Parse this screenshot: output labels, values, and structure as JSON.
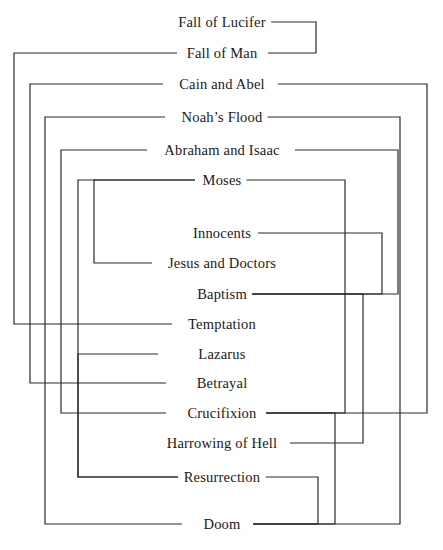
{
  "diagram": {
    "title": "Fall of Lucifer",
    "type": "episode-linkage-diagram",
    "line_color": "#2a2a2a",
    "background_color": "#ffffff",
    "text_color": "#1a1a1a",
    "episodes": [
      {
        "id": "fall-of-lucifer",
        "label": "Fall of Lucifer",
        "y": 22,
        "cx": 222
      },
      {
        "id": "fall-of-man",
        "label": "Fall of Man",
        "y": 53,
        "cx": 222
      },
      {
        "id": "cain-and-abel",
        "label": "Cain and Abel",
        "y": 84,
        "cx": 222
      },
      {
        "id": "noahs-flood",
        "label": "Noah’s Flood",
        "y": 117,
        "cx": 222
      },
      {
        "id": "abraham-and-isaac",
        "label": "Abraham and Isaac",
        "y": 150,
        "cx": 222
      },
      {
        "id": "moses",
        "label": "Moses",
        "y": 180,
        "cx": 222
      },
      {
        "id": "innocents",
        "label": "Innocents",
        "y": 233,
        "cx": 222
      },
      {
        "id": "jesus-and-doctors",
        "label": "Jesus and Doctors",
        "y": 263,
        "cx": 222
      },
      {
        "id": "baptism",
        "label": "Baptism",
        "y": 294,
        "cx": 222
      },
      {
        "id": "temptation",
        "label": "Temptation",
        "y": 324,
        "cx": 222
      },
      {
        "id": "lazarus",
        "label": "Lazarus",
        "y": 354,
        "cx": 222
      },
      {
        "id": "betrayal",
        "label": "Betrayal",
        "y": 383,
        "cx": 222
      },
      {
        "id": "crucifixion",
        "label": "Crucifixion",
        "y": 413,
        "cx": 222
      },
      {
        "id": "harrowing-of-hell",
        "label": "Harrowing of Hell",
        "y": 443,
        "cx": 222
      },
      {
        "id": "resurrection",
        "label": "Resurrection",
        "y": 477,
        "cx": 222
      },
      {
        "id": "doom",
        "label": "Doom",
        "y": 524,
        "cx": 222
      }
    ],
    "links": [
      {
        "id": "lucifer-to-man",
        "from": "fall-of-lucifer",
        "to": "fall-of-man",
        "side": "right",
        "stub_from": 264,
        "stub_to": 268,
        "rail": 316
      },
      {
        "id": "man-to-temptation",
        "from": "fall-of-man",
        "to": "temptation",
        "side": "left",
        "stub_from": 177,
        "stub_to": 172,
        "rail": 14
      },
      {
        "id": "cain-to-crucifixion",
        "from": "cain-and-abel",
        "to": "crucifixion",
        "side": "right",
        "stub_from": 278,
        "stub_to": 266,
        "rail": 427
      },
      {
        "id": "cain-to-betrayal",
        "from": "cain-and-abel",
        "to": "betrayal",
        "side": "left",
        "stub_from": 163,
        "stub_to": 166,
        "rail": 30
      },
      {
        "id": "noah-to-doom",
        "from": "noahs-flood",
        "to": "doom",
        "side": "right",
        "stub_from": 262,
        "stub_to": 253,
        "rail": 400
      },
      {
        "id": "noah-to-doom-left",
        "from": "noahs-flood",
        "to": "doom",
        "side": "left",
        "stub_from": 165,
        "stub_to": 182,
        "rail": 45
      },
      {
        "id": "abraham-to-baptism",
        "from": "abraham-and-isaac",
        "to": "baptism",
        "side": "right",
        "stub_from": 295,
        "stub_to": 248,
        "rail": 398
      },
      {
        "id": "abraham-to-crucifixion",
        "from": "abraham-and-isaac",
        "to": "crucifixion",
        "side": "left",
        "stub_from": 147,
        "stub_to": 166,
        "rail": 61
      },
      {
        "id": "moses-to-crucifixion",
        "from": "moses",
        "to": "crucifixion",
        "side": "right",
        "stub_from": 243,
        "stub_to": 266,
        "rail": 345
      },
      {
        "id": "moses-to-resurrection",
        "from": "moses",
        "to": "resurrection",
        "side": "left",
        "stub_from": 195,
        "stub_to": 178,
        "rail": 78
      },
      {
        "id": "moses-to-jesusdoctors",
        "from": "moses",
        "to": "jesus-and-doctors",
        "side": "left",
        "stub_from": 195,
        "stub_to": 152,
        "rail": 94
      },
      {
        "id": "innocents-to-baptism",
        "from": "innocents",
        "to": "baptism",
        "side": "right",
        "stub_from": 258,
        "stub_to": 248,
        "rail": 382
      },
      {
        "id": "baptism-to-harrowing",
        "from": "baptism",
        "to": "harrowing-of-hell",
        "side": "right",
        "stub_from": 248,
        "stub_to": 290,
        "rail": 363
      },
      {
        "id": "lazarus-to-resurrect",
        "from": "lazarus",
        "to": "resurrection",
        "side": "left",
        "stub_from": 158,
        "stub_to": 178,
        "rail": 78
      },
      {
        "id": "crucifixion-to-doom",
        "from": "crucifixion",
        "to": "doom",
        "side": "right",
        "stub_from": 266,
        "stub_to": 253,
        "rail": 335
      },
      {
        "id": "resurrection-to-doom",
        "from": "resurrection",
        "to": "doom",
        "side": "right",
        "stub_from": 246,
        "stub_to": 253,
        "rail": 318
      }
    ]
  }
}
